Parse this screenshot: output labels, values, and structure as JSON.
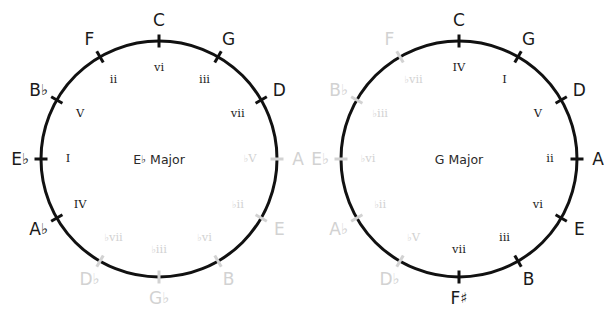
{
  "figures": [
    {
      "id": "eb-major-circle",
      "center_label": "E♭ Major",
      "center": {
        "x": 159,
        "y": 159
      },
      "radius": 118,
      "positions": [
        {
          "note": "C",
          "degree": "vi",
          "angle": 0,
          "note_dim": false,
          "degree_dim": false
        },
        {
          "note": "G",
          "degree": "iii",
          "angle": 30,
          "note_dim": false,
          "degree_dim": false
        },
        {
          "note": "D",
          "degree": "vii",
          "angle": 60,
          "note_dim": false,
          "degree_dim": false
        },
        {
          "note": "A",
          "degree": "♭V",
          "angle": 90,
          "note_dim": true,
          "degree_dim": true
        },
        {
          "note": "E",
          "degree": "♭ii",
          "angle": 120,
          "note_dim": true,
          "degree_dim": true
        },
        {
          "note": "B",
          "degree": "♭vi",
          "angle": 150,
          "note_dim": true,
          "degree_dim": true
        },
        {
          "note": "G♭",
          "degree": "♭iii",
          "angle": 180,
          "note_dim": true,
          "degree_dim": true
        },
        {
          "note": "D♭",
          "degree": "♭vii",
          "angle": 210,
          "note_dim": true,
          "degree_dim": true
        },
        {
          "note": "A♭",
          "degree": "IV",
          "angle": 240,
          "note_dim": false,
          "degree_dim": false
        },
        {
          "note": "E♭",
          "degree": "I",
          "angle": 270,
          "note_dim": false,
          "degree_dim": false
        },
        {
          "note": "B♭",
          "degree": "V",
          "angle": 300,
          "note_dim": false,
          "degree_dim": false
        },
        {
          "note": "F",
          "degree": "ii",
          "angle": 330,
          "note_dim": false,
          "degree_dim": false
        }
      ]
    },
    {
      "id": "g-major-circle",
      "center_label": "G Major",
      "center": {
        "x": 159,
        "y": 159
      },
      "radius": 118,
      "positions": [
        {
          "note": "C",
          "degree": "IV",
          "angle": 0,
          "note_dim": false,
          "degree_dim": false
        },
        {
          "note": "G",
          "degree": "I",
          "angle": 30,
          "note_dim": false,
          "degree_dim": false
        },
        {
          "note": "D",
          "degree": "V",
          "angle": 60,
          "note_dim": false,
          "degree_dim": false
        },
        {
          "note": "A",
          "degree": "ii",
          "angle": 90,
          "note_dim": false,
          "degree_dim": false
        },
        {
          "note": "E",
          "degree": "vi",
          "angle": 120,
          "note_dim": false,
          "degree_dim": false
        },
        {
          "note": "B",
          "degree": "iii",
          "angle": 150,
          "note_dim": false,
          "degree_dim": false
        },
        {
          "note": "F♯",
          "degree": "vii",
          "angle": 180,
          "note_dim": false,
          "degree_dim": false
        },
        {
          "note": "D♭",
          "degree": "♭V",
          "angle": 210,
          "note_dim": true,
          "degree_dim": true
        },
        {
          "note": "A♭",
          "degree": "♭ii",
          "angle": 240,
          "note_dim": true,
          "degree_dim": true
        },
        {
          "note": "E♭",
          "degree": "♭vi",
          "angle": 270,
          "note_dim": true,
          "degree_dim": true
        },
        {
          "note": "B♭",
          "degree": "♭iii",
          "angle": 300,
          "note_dim": true,
          "degree_dim": true
        },
        {
          "note": "F",
          "degree": "♭vii",
          "angle": 330,
          "note_dim": true,
          "degree_dim": true
        }
      ]
    }
  ],
  "style": {
    "stroke_color": "#111111",
    "dim_color": "#d2d2d2",
    "background": "#ffffff",
    "circle_stroke_width": 3,
    "tick_stroke_width": 3,
    "tick_length": 13,
    "note_radius_offset": 21,
    "degree_radius_offset": 27
  }
}
